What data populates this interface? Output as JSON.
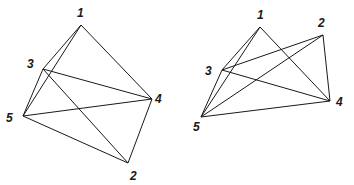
{
  "figures": [
    {
      "name": "left-graph",
      "vertices": {
        "1": {
          "x": 81,
          "y": 25,
          "lx": 77,
          "ly": 17,
          "label": "1"
        },
        "2": {
          "x": 128,
          "y": 163,
          "lx": 130,
          "ly": 180,
          "label": "2"
        },
        "3": {
          "x": 43,
          "y": 69,
          "lx": 27,
          "ly": 68,
          "label": "3"
        },
        "4": {
          "x": 152,
          "y": 99,
          "lx": 155,
          "ly": 103,
          "label": "4"
        },
        "5": {
          "x": 23,
          "y": 116,
          "lx": 6,
          "ly": 122,
          "label": "5"
        }
      },
      "edges": [
        [
          "1",
          "3"
        ],
        [
          "1",
          "5"
        ],
        [
          "1",
          "4"
        ],
        [
          "3",
          "5"
        ],
        [
          "3",
          "4"
        ],
        [
          "3",
          "2"
        ],
        [
          "5",
          "4"
        ],
        [
          "5",
          "2"
        ],
        [
          "4",
          "2"
        ]
      ]
    },
    {
      "name": "right-graph",
      "vertices": {
        "1": {
          "x": 260,
          "y": 27,
          "lx": 257,
          "ly": 19,
          "label": "1"
        },
        "2": {
          "x": 323,
          "y": 35,
          "lx": 318,
          "ly": 27,
          "label": "2"
        },
        "3": {
          "x": 222,
          "y": 70,
          "lx": 205,
          "ly": 75,
          "label": "3"
        },
        "4": {
          "x": 330,
          "y": 101,
          "lx": 336,
          "ly": 106,
          "label": "4"
        },
        "5": {
          "x": 201,
          "y": 117,
          "lx": 193,
          "ly": 131,
          "label": "5"
        }
      },
      "edges": [
        [
          "1",
          "3"
        ],
        [
          "1",
          "5"
        ],
        [
          "1",
          "4"
        ],
        [
          "3",
          "5"
        ],
        [
          "3",
          "2"
        ],
        [
          "3",
          "4"
        ],
        [
          "5",
          "2"
        ],
        [
          "5",
          "4"
        ],
        [
          "2",
          "4"
        ]
      ]
    }
  ]
}
